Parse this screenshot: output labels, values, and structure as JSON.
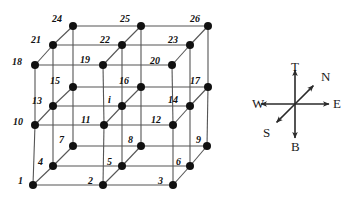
{
  "diagram": {
    "center_label": "i",
    "node_color": "#111111",
    "edge_color": "#555555",
    "node_radius": 4,
    "nodes": [
      {
        "id": "1",
        "label": "1",
        "x": 33,
        "y": 185,
        "lx": 18,
        "ly": 176
      },
      {
        "id": "2",
        "label": "2",
        "x": 103,
        "y": 185,
        "lx": 88,
        "ly": 176
      },
      {
        "id": "3",
        "label": "3",
        "x": 173,
        "y": 185,
        "lx": 158,
        "ly": 176
      },
      {
        "id": "4",
        "label": "4",
        "x": 53,
        "y": 166,
        "lx": 38,
        "ly": 157
      },
      {
        "id": "5",
        "label": "5",
        "x": 122,
        "y": 166,
        "lx": 107,
        "ly": 157
      },
      {
        "id": "6",
        "label": "6",
        "x": 190,
        "y": 166,
        "lx": 176,
        "ly": 157
      },
      {
        "id": "7",
        "label": "7",
        "x": 73,
        "y": 146,
        "lx": 59,
        "ly": 135
      },
      {
        "id": "8",
        "label": "8",
        "x": 141,
        "y": 146,
        "lx": 128,
        "ly": 135
      },
      {
        "id": "9",
        "label": "9",
        "x": 207,
        "y": 146,
        "lx": 196,
        "ly": 135
      },
      {
        "id": "10",
        "label": "10",
        "x": 35,
        "y": 125,
        "lx": 13,
        "ly": 117
      },
      {
        "id": "11",
        "label": "11",
        "x": 104,
        "y": 125,
        "lx": 81,
        "ly": 115
      },
      {
        "id": "12",
        "label": "12",
        "x": 173,
        "y": 125,
        "lx": 151,
        "ly": 115
      },
      {
        "id": "13",
        "label": "13",
        "x": 53,
        "y": 106,
        "lx": 32,
        "ly": 96
      },
      {
        "id": "i",
        "label": "i",
        "x": 122,
        "y": 106,
        "lx": 108,
        "ly": 95
      },
      {
        "id": "14",
        "label": "14",
        "x": 190,
        "y": 106,
        "lx": 168,
        "ly": 95
      },
      {
        "id": "15",
        "label": "15",
        "x": 73,
        "y": 87,
        "lx": 50,
        "ly": 76
      },
      {
        "id": "16",
        "label": "16",
        "x": 141,
        "y": 87,
        "lx": 119,
        "ly": 76
      },
      {
        "id": "17",
        "label": "17",
        "x": 208,
        "y": 87,
        "lx": 190,
        "ly": 76
      },
      {
        "id": "18",
        "label": "18",
        "x": 35,
        "y": 65,
        "lx": 12,
        "ly": 57
      },
      {
        "id": "19",
        "label": "19",
        "x": 103,
        "y": 65,
        "lx": 80,
        "ly": 55
      },
      {
        "id": "20",
        "label": "20",
        "x": 172,
        "y": 65,
        "lx": 150,
        "ly": 56
      },
      {
        "id": "21",
        "label": "21",
        "x": 53,
        "y": 45,
        "lx": 31,
        "ly": 35
      },
      {
        "id": "22",
        "label": "22",
        "x": 122,
        "y": 45,
        "lx": 100,
        "ly": 35
      },
      {
        "id": "23",
        "label": "23",
        "x": 190,
        "y": 45,
        "lx": 168,
        "ly": 35
      },
      {
        "id": "24",
        "label": "24",
        "x": 73,
        "y": 26,
        "lx": 52,
        "ly": 14
      },
      {
        "id": "25",
        "label": "25",
        "x": 141,
        "y": 26,
        "lx": 120,
        "ly": 14
      },
      {
        "id": "26",
        "label": "26",
        "x": 208,
        "y": 26,
        "lx": 190,
        "ly": 14
      }
    ],
    "edges": [
      [
        "1",
        "2"
      ],
      [
        "2",
        "3"
      ],
      [
        "10",
        "11"
      ],
      [
        "11",
        "12"
      ],
      [
        "18",
        "19"
      ],
      [
        "19",
        "20"
      ],
      [
        "4",
        "5"
      ],
      [
        "5",
        "6"
      ],
      [
        "13",
        "i"
      ],
      [
        "i",
        "14"
      ],
      [
        "21",
        "22"
      ],
      [
        "22",
        "23"
      ],
      [
        "7",
        "8"
      ],
      [
        "8",
        "9"
      ],
      [
        "15",
        "16"
      ],
      [
        "16",
        "17"
      ],
      [
        "24",
        "25"
      ],
      [
        "25",
        "26"
      ],
      [
        "1",
        "10"
      ],
      [
        "10",
        "18"
      ],
      [
        "2",
        "11"
      ],
      [
        "11",
        "19"
      ],
      [
        "3",
        "12"
      ],
      [
        "12",
        "20"
      ],
      [
        "4",
        "13"
      ],
      [
        "13",
        "21"
      ],
      [
        "5",
        "i"
      ],
      [
        "i",
        "22"
      ],
      [
        "6",
        "14"
      ],
      [
        "14",
        "23"
      ],
      [
        "7",
        "15"
      ],
      [
        "15",
        "24"
      ],
      [
        "8",
        "16"
      ],
      [
        "16",
        "25"
      ],
      [
        "9",
        "17"
      ],
      [
        "17",
        "26"
      ],
      [
        "1",
        "4"
      ],
      [
        "4",
        "7"
      ],
      [
        "2",
        "5"
      ],
      [
        "5",
        "8"
      ],
      [
        "3",
        "6"
      ],
      [
        "6",
        "9"
      ],
      [
        "10",
        "13"
      ],
      [
        "13",
        "15"
      ],
      [
        "11",
        "i"
      ],
      [
        "i",
        "16"
      ],
      [
        "12",
        "14"
      ],
      [
        "14",
        "17"
      ],
      [
        "18",
        "21"
      ],
      [
        "21",
        "24"
      ],
      [
        "19",
        "22"
      ],
      [
        "22",
        "25"
      ],
      [
        "20",
        "23"
      ],
      [
        "23",
        "26"
      ]
    ]
  },
  "compass": {
    "center": {
      "x": 295,
      "y": 104
    },
    "axes": [
      {
        "id": "top",
        "label": "T",
        "dir": "up",
        "lx": 291,
        "ly": 60
      },
      {
        "id": "bottom",
        "label": "B",
        "dir": "down",
        "lx": 291,
        "ly": 140
      },
      {
        "id": "west",
        "label": "W",
        "dir": "left",
        "lx": 252,
        "ly": 97
      },
      {
        "id": "east",
        "label": "E",
        "dir": "right",
        "lx": 333,
        "ly": 97
      },
      {
        "id": "north",
        "label": "N",
        "dir": "up-right",
        "lx": 321,
        "ly": 70
      },
      {
        "id": "south",
        "label": "S",
        "dir": "down-left",
        "lx": 263,
        "ly": 126
      }
    ],
    "arm": 34,
    "diag_arm": 26,
    "stroke": "#2a2a2a"
  }
}
